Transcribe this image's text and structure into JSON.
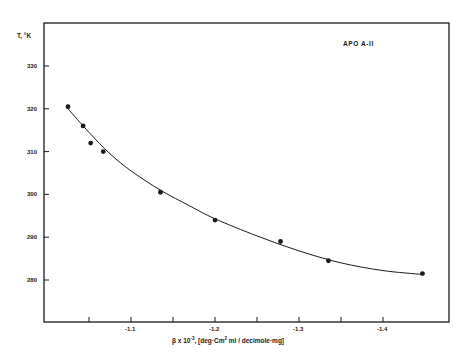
{
  "chart_data": {
    "type": "scatter",
    "title": "",
    "annotation": "APO A-II",
    "xlabel": "β x 10⁻³, [deg·Cm² ml / decimole·mg]",
    "ylabel": "T, °K",
    "xlim": [
      -1.0,
      -1.48
    ],
    "ylim": [
      270,
      340
    ],
    "x_ticks": [
      -1.05,
      -1.1,
      -1.15,
      -1.2,
      -1.25,
      -1.3,
      -1.35,
      -1.4
    ],
    "x_tick_labels": [
      "",
      "-1.1",
      "",
      "-1.2",
      "",
      "-1.3",
      "",
      "-1.4"
    ],
    "y_ticks": [
      280,
      290,
      300,
      310,
      320,
      330
    ],
    "y_tick_labels": [
      "280",
      "290",
      "300",
      "310",
      "320",
      "330"
    ],
    "grid": false,
    "legend": null,
    "series": [
      {
        "name": "APO A-II measured",
        "marker": "filled-circle",
        "x": [
          -1.025,
          -1.043,
          -1.052,
          -1.067,
          -1.135,
          -1.2,
          -1.278,
          -1.335,
          -1.447
        ],
        "y": [
          320.5,
          316,
          312,
          310,
          300.5,
          294,
          289,
          284.5,
          281.5
        ]
      },
      {
        "name": "fitted curve",
        "style": "smooth-line",
        "x": [
          -1.025,
          -1.05,
          -1.075,
          -1.1,
          -1.135,
          -1.17,
          -1.2,
          -1.25,
          -1.3,
          -1.35,
          -1.4,
          -1.447
        ],
        "y": [
          320,
          314.5,
          309.5,
          305.5,
          301,
          297.3,
          294.3,
          290.3,
          286.8,
          284,
          282.2,
          281.3
        ]
      }
    ]
  },
  "labels": {
    "ylabel": "T, °K",
    "annotation": "APO A-II",
    "xlabel_prefix": "β x 10",
    "xlabel_exp": "-3",
    "xlabel_unit_a": ", [deg·Cm",
    "xlabel_unit_sup": "2",
    "xlabel_unit_b": " ml / decimole·mg]",
    "y_ticks": [
      "280",
      "290",
      "300",
      "310",
      "320",
      "330"
    ],
    "x_ticks": [
      "-1.1",
      "-1.2",
      "-1.3",
      "-1.4"
    ]
  },
  "colors": {
    "ink": "#1a1a1a",
    "background": "#ffffff"
  }
}
